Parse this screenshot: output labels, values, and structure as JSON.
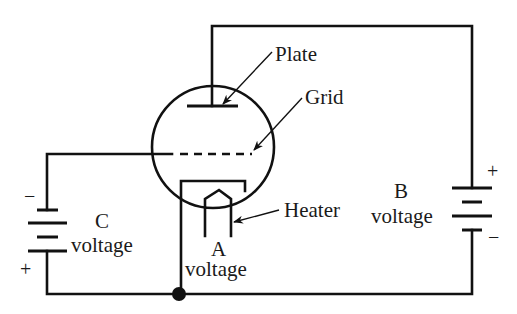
{
  "diagram": {
    "type": "circuit-schematic",
    "colors": {
      "line": "#111111",
      "text": "#1a1a1a",
      "background": "#ffffff"
    },
    "components": {
      "tube": {
        "name": "Vacuum tube (triode)",
        "elements": [
          "Plate",
          "Grid",
          "Cathode",
          "Heater"
        ]
      },
      "battery_c": {
        "name": "C voltage",
        "polarity_top": "−",
        "polarity_bottom": "+"
      },
      "battery_b": {
        "name": "B voltage",
        "polarity_top": "+",
        "polarity_bottom": "−"
      },
      "heater_supply": {
        "name": "A voltage"
      },
      "junction": {
        "name": "Ground junction node"
      }
    },
    "labels": {
      "plate": "Plate",
      "grid": "Grid",
      "heater": "Heater",
      "c_letter": "C",
      "c_voltage": "voltage",
      "a_letter": "A",
      "a_voltage": "voltage",
      "b_letter": "B",
      "b_voltage": "voltage",
      "c_minus": "−",
      "c_plus": "+",
      "b_plus": "+",
      "b_minus": "−"
    },
    "connections": [
      {
        "from": "Plate",
        "to": "B voltage +"
      },
      {
        "from": "B voltage −",
        "to": "Ground junction"
      },
      {
        "from": "Grid",
        "to": "C voltage −"
      },
      {
        "from": "C voltage +",
        "to": "Ground junction"
      },
      {
        "from": "Cathode",
        "to": "Ground junction"
      }
    ]
  }
}
